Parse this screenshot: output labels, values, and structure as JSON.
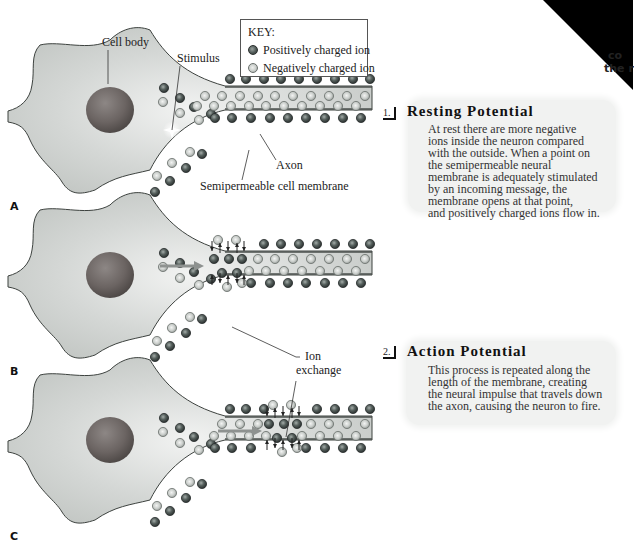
{
  "colors": {
    "cell_fill": "#cfd2d0",
    "cell_stroke": "#3d423f",
    "axon_fill": "#c6cac7",
    "membrane_line": "#4a4f4c",
    "nucleus": "#6a6462",
    "positive_ion": "#4f5956",
    "negative_ion": "#cdd1ce",
    "info_box_bg": "#f1f2f1",
    "arrow_gray": "#8e9290"
  },
  "key": {
    "title": "KEY:",
    "items": [
      {
        "kind": "positive",
        "label": "Positively charged ion"
      },
      {
        "kind": "negative",
        "label": "Negatively charged ion"
      }
    ]
  },
  "labels": {
    "cell_body": "Cell body",
    "stimulus": "Stimulus",
    "axon": "Axon",
    "membrane": "Semipermeable cell membrane",
    "ion_exchange_line1": "Ion",
    "ion_exchange_line2": "exchange"
  },
  "panels": [
    {
      "letter": "A",
      "offset_y": 0
    },
    {
      "letter": "B",
      "offset_y": 165
    },
    {
      "letter": "C",
      "offset_y": 330
    }
  ],
  "steps": [
    {
      "number": "1.",
      "title": "Resting Potential",
      "body_lines": [
        "At rest there are more negative",
        "ions inside the neuron compared",
        "with the outside. When a point on",
        "the semipermeable neural",
        "membrane is adequately stimulated",
        "by an incoming message, the",
        "membrane opens at that point,",
        "and positively charged ions flow in."
      ]
    },
    {
      "number": "2.",
      "title": "Action Potential",
      "body_lines": [
        "This process is repeated along the",
        "length of the membrane, creating",
        "the neural impulse that travels down",
        "the axon, causing the neuron to fire."
      ]
    }
  ],
  "corner": {
    "line1": "co",
    "line2": "the r"
  }
}
